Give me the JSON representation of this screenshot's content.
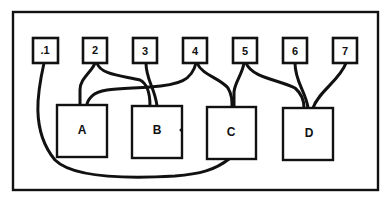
{
  "diagram": {
    "type": "wiring-diagram",
    "terminals": [
      {
        "id": "1",
        "label": ".1"
      },
      {
        "id": "2",
        "label": "2"
      },
      {
        "id": "3",
        "label": "3"
      },
      {
        "id": "4",
        "label": "4"
      },
      {
        "id": "5",
        "label": "5"
      },
      {
        "id": "6",
        "label": "6"
      },
      {
        "id": "7",
        "label": "7"
      }
    ],
    "modules": [
      {
        "id": "A",
        "label": "A"
      },
      {
        "id": "B",
        "label": "B"
      },
      {
        "id": "C",
        "label": "C"
      },
      {
        "id": "D",
        "label": "D"
      }
    ],
    "connections": [
      {
        "from": "1",
        "to": "C"
      },
      {
        "from": "2",
        "to": "A"
      },
      {
        "from": "2",
        "to": "B"
      },
      {
        "from": "3",
        "to": "B"
      },
      {
        "from": "4",
        "to": "A"
      },
      {
        "from": "4",
        "to": "C"
      },
      {
        "from": "5",
        "to": "C"
      },
      {
        "from": "5",
        "to": "D"
      },
      {
        "from": "6",
        "to": "D"
      },
      {
        "from": "7",
        "to": "D"
      }
    ],
    "colors": {
      "line": "#111111",
      "background": "#ffffff"
    }
  }
}
